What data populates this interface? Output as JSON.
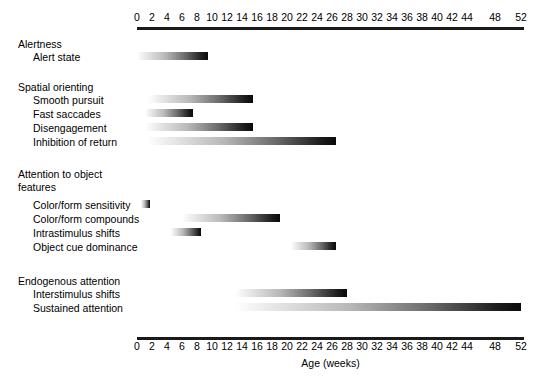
{
  "chart_data": {
    "type": "bar",
    "title": "",
    "xlabel": "Age (weeks)",
    "ylabel": "",
    "orientation": "horizontal",
    "grid": false,
    "legend": null,
    "xlim": [
      0,
      52
    ],
    "x_tick_labels": [
      "0",
      "2",
      "4",
      "6",
      "8",
      "10",
      "12",
      "14",
      "16",
      "18",
      "20",
      "22",
      "24",
      "26",
      "28",
      "30",
      "32",
      "34",
      "36",
      "38",
      "40",
      "42",
      "44",
      "48",
      "52"
    ],
    "x_tick_positions_px": [
      137,
      152,
      167,
      182,
      197,
      212,
      227,
      242,
      257,
      272,
      287,
      302,
      317,
      332,
      347,
      362,
      377,
      392,
      407,
      422,
      437,
      452,
      467,
      495,
      521
    ],
    "note": "Bars are gradient-filled from light (emerging) to dark (established); x axis spacing is even for 0-44 then continues to 48 and 52.",
    "groups": [
      {
        "name": "Alertness",
        "items": [
          {
            "label": "Alert state",
            "start": 0,
            "end": 9.5
          }
        ]
      },
      {
        "name": "Spatial orienting",
        "items": [
          {
            "label": "Smooth pursuit",
            "start": 1.5,
            "end": 15.5
          },
          {
            "label": "Fast saccades",
            "start": 1.0,
            "end": 7.5
          },
          {
            "label": "Disengagement",
            "start": 1.0,
            "end": 15.5
          },
          {
            "label": "Inhibition of return",
            "start": 1.5,
            "end": 26.5
          }
        ]
      },
      {
        "name": "Attention to object\nfeatures",
        "items": [
          {
            "label": "Color/form sensitivity",
            "start": 0.5,
            "end": 1.7
          },
          {
            "label": "Color/form compounds",
            "start": 6.0,
            "end": 19.0
          },
          {
            "label": "Intrastimulus shifts",
            "start": 4.5,
            "end": 8.5
          },
          {
            "label": "Object cue dominance",
            "start": 20.5,
            "end": 26.5
          }
        ]
      },
      {
        "name": "Endogenous attention",
        "items": [
          {
            "label": "Interstimulus shifts",
            "start": 13.0,
            "end": 28.0
          },
          {
            "label": "Sustained attention",
            "start": 13.0,
            "end": 52.0
          }
        ]
      }
    ]
  },
  "layout": {
    "group_label_tops": [
      38,
      81,
      168,
      275
    ],
    "item_rows": [
      {
        "label_top": 51,
        "bar_top": 52
      },
      {
        "label_top": 94,
        "bar_top": 95
      },
      {
        "label_top": 108,
        "bar_top": 109
      },
      {
        "label_top": 122,
        "bar_top": 123
      },
      {
        "label_top": 136,
        "bar_top": 137
      },
      {
        "label_top": 199,
        "bar_top": 200
      },
      {
        "label_top": 213,
        "bar_top": 214
      },
      {
        "label_top": 227,
        "bar_top": 228
      },
      {
        "label_top": 241,
        "bar_top": 242
      },
      {
        "label_top": 288,
        "bar_top": 289
      },
      {
        "label_top": 302,
        "bar_top": 303
      }
    ]
  },
  "colors": {
    "axis": "#1a1a1a",
    "text": "#000000",
    "background": "#ffffff",
    "bar_start": "#ffffff",
    "bar_end": "#0a0a0a"
  }
}
